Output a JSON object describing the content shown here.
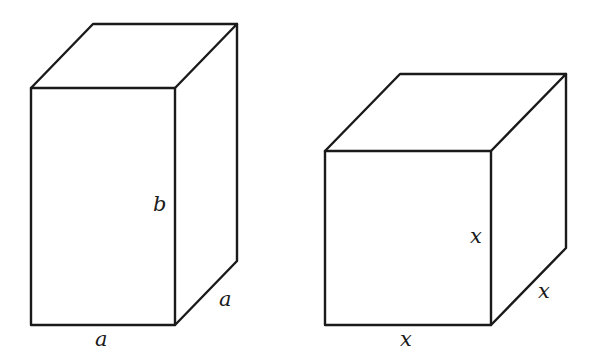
{
  "figures": [
    {
      "name": "rectangular-prism",
      "front": {
        "x1": 31,
        "y1": 88,
        "x2": 175,
        "y2": 325
      },
      "depth": {
        "dx": 62,
        "dy": -64
      },
      "labels": {
        "height": {
          "text": "b",
          "x": 153,
          "y": 211
        },
        "depth": {
          "text": "a",
          "x": 219,
          "y": 306
        },
        "width": {
          "text": "a",
          "x": 95,
          "y": 346
        }
      }
    },
    {
      "name": "cube",
      "front": {
        "x1": 325,
        "y1": 151,
        "x2": 491,
        "y2": 325
      },
      "depth": {
        "dx": 75,
        "dy": -77
      },
      "labels": {
        "height": {
          "text": "x",
          "x": 470,
          "y": 243
        },
        "depth": {
          "text": "x",
          "x": 538,
          "y": 298
        },
        "width": {
          "text": "x",
          "x": 400,
          "y": 346
        }
      }
    }
  ],
  "colors": {
    "stroke": "#1a1a1a",
    "background": "#ffffff"
  }
}
